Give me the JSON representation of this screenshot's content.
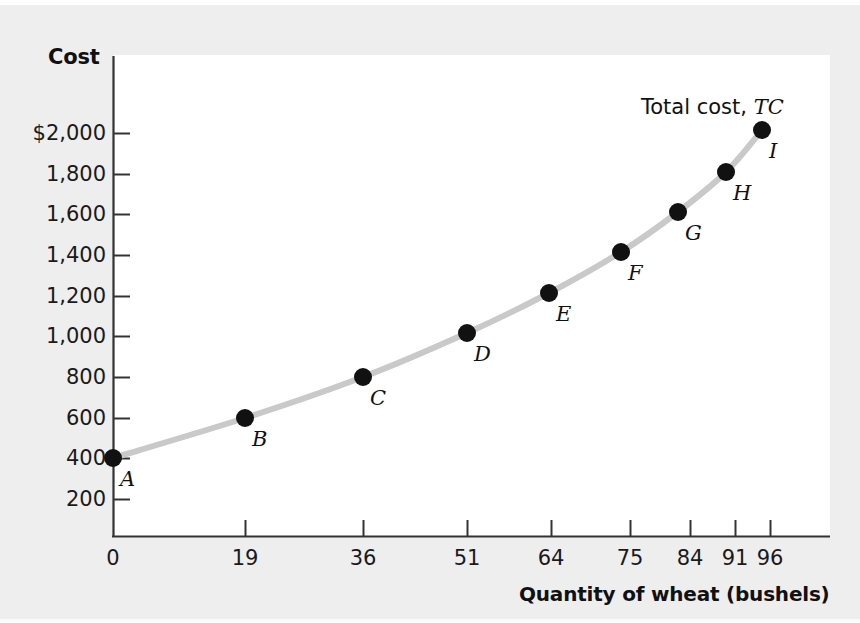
{
  "figure": {
    "plot_background": "#ffffff",
    "page_background": "#eeeeee",
    "axis_color": "#333333",
    "curve_color": "#c9c9c9",
    "point_color": "#111111"
  },
  "labels": {
    "y_axis_title": "Cost",
    "x_axis_title": "Quantity of wheat (bushels)",
    "curve_annotation_text": "Total cost,",
    "curve_annotation_symbol": "TC"
  },
  "chart_data": {
    "type": "line",
    "title": "",
    "xlabel": "Quantity of wheat (bushels)",
    "ylabel": "Cost",
    "xlim": [
      0,
      100
    ],
    "ylim": [
      0,
      2100
    ],
    "grid": false,
    "legend": "inline-annotation",
    "x_tick_labels": [
      "0",
      "19",
      "36",
      "51",
      "64",
      "75",
      "84",
      "91",
      "96"
    ],
    "x_tick_values": [
      0,
      19,
      36,
      51,
      64,
      75,
      84,
      91,
      96
    ],
    "y_tick_labels": [
      "200",
      "400",
      "600",
      "800",
      "1,000",
      "1,200",
      "1,400",
      "1,600",
      "1,800",
      "$2,000"
    ],
    "y_tick_values": [
      200,
      400,
      600,
      800,
      1000,
      1200,
      1400,
      1600,
      1800,
      2000
    ],
    "series": [
      {
        "name": "Total cost, TC",
        "x": [
          0,
          19,
          36,
          51,
          64,
          75,
          84,
          91,
          96
        ],
        "values": [
          400,
          600,
          800,
          1000,
          1200,
          1400,
          1600,
          1800,
          2000
        ],
        "point_labels": [
          "A",
          "B",
          "C",
          "D",
          "E",
          "F",
          "G",
          "H",
          "I"
        ]
      }
    ],
    "points": [
      {
        "label": "A",
        "x": 0,
        "y": 400
      },
      {
        "label": "B",
        "x": 19,
        "y": 600
      },
      {
        "label": "C",
        "x": 36,
        "y": 800
      },
      {
        "label": "D",
        "x": 51,
        "y": 1000
      },
      {
        "label": "E",
        "x": 64,
        "y": 1200
      },
      {
        "label": "F",
        "x": 75,
        "y": 1400
      },
      {
        "label": "G",
        "x": 84,
        "y": 1600
      },
      {
        "label": "H",
        "x": 91,
        "y": 1800
      },
      {
        "label": "I",
        "x": 96,
        "y": 2000
      }
    ]
  },
  "pixel_layout": {
    "y_ticks_px": [
      {
        "label": "$2,000",
        "y": 133
      },
      {
        "label": "1,800",
        "y": 174
      },
      {
        "label": "1,600",
        "y": 214
      },
      {
        "label": "1,400",
        "y": 255
      },
      {
        "label": "1,200",
        "y": 296
      },
      {
        "label": "1,000",
        "y": 336
      },
      {
        "label": "800",
        "y": 377
      },
      {
        "label": "600",
        "y": 418
      },
      {
        "label": "400",
        "y": 458
      },
      {
        "label": "200",
        "y": 499
      }
    ],
    "x_ticks_px": [
      {
        "label": "0",
        "x": 113
      },
      {
        "label": "19",
        "x": 245
      },
      {
        "label": "36",
        "x": 363
      },
      {
        "label": "51",
        "x": 467
      },
      {
        "label": "64",
        "x": 551
      },
      {
        "label": "75",
        "x": 630
      },
      {
        "label": "84",
        "x": 690
      },
      {
        "label": "91",
        "x": 735
      },
      {
        "label": "96",
        "x": 770
      }
    ],
    "points_px": [
      {
        "label": "A",
        "x": 113,
        "y": 458,
        "lx": 120,
        "ly": 467
      },
      {
        "label": "B",
        "x": 245,
        "y": 418,
        "lx": 252,
        "ly": 427
      },
      {
        "label": "C",
        "x": 363,
        "y": 377,
        "lx": 370,
        "ly": 386
      },
      {
        "label": "D",
        "x": 467,
        "y": 333,
        "lx": 474,
        "ly": 342
      },
      {
        "label": "E",
        "x": 549,
        "y": 293,
        "lx": 556,
        "ly": 302
      },
      {
        "label": "F",
        "x": 621,
        "y": 252,
        "lx": 628,
        "ly": 261
      },
      {
        "label": "G",
        "x": 678,
        "y": 212,
        "lx": 685,
        "ly": 221
      },
      {
        "label": "H",
        "x": 726,
        "y": 172,
        "lx": 733,
        "ly": 181
      },
      {
        "label": "I",
        "x": 762,
        "y": 130,
        "lx": 769,
        "ly": 139
      }
    ]
  }
}
